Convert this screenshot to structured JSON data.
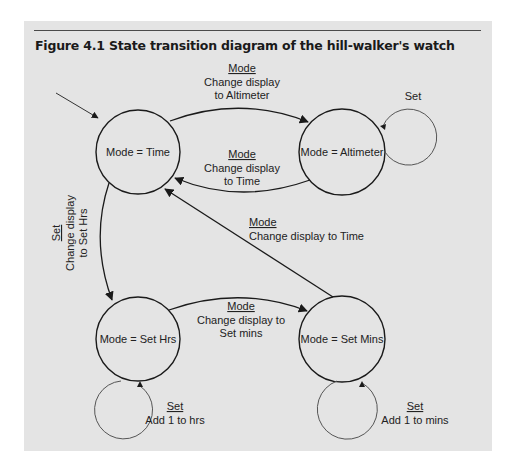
{
  "figure": {
    "title": "Figure 4.1  State transition diagram of the hill-walker's watch"
  },
  "colors": {
    "panel_background": "#e4e4e4",
    "line": "#1a1a1a",
    "loop_line": "#555555",
    "text": "#222222"
  },
  "states": [
    {
      "id": "time",
      "label": "Mode = Time"
    },
    {
      "id": "altimeter",
      "label": "Mode = Altimeter"
    },
    {
      "id": "set_hrs",
      "label": "Mode = Set Hrs"
    },
    {
      "id": "set_mins",
      "label": "Mode = Set Mins"
    }
  ],
  "transitions": {
    "time_to_altimeter": {
      "event": "Mode",
      "action_line1": "Change display",
      "action_line2": "to Altimeter"
    },
    "altimeter_to_time": {
      "event": "Mode",
      "action_line1": "Change display",
      "action_line2": "to Time"
    },
    "altimeter_self": {
      "event": "Set"
    },
    "time_to_set_hrs": {
      "event": "Set",
      "action_line1": "Change display",
      "action_line2": "to Set Hrs"
    },
    "set_mins_to_time": {
      "event": "Mode",
      "action_line1": "Change display to Time"
    },
    "set_hrs_to_set_mins": {
      "event": "Mode",
      "action_line1": "Change display to",
      "action_line2": "Set mins"
    },
    "set_hrs_self": {
      "event": "Set",
      "action_line1": "Add 1 to hrs"
    },
    "set_mins_self": {
      "event": "Set",
      "action_line1": "Add 1 to mins"
    }
  }
}
